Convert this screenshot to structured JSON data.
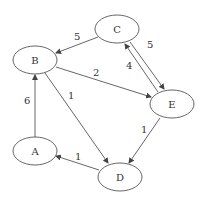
{
  "graph": {
    "type": "weighted directed graph",
    "nodes": [
      {
        "id": "A",
        "label": "A",
        "x": 35,
        "y": 151
      },
      {
        "id": "B",
        "label": "B",
        "x": 35,
        "y": 60
      },
      {
        "id": "C",
        "label": "C",
        "x": 117,
        "y": 29
      },
      {
        "id": "D",
        "label": "D",
        "x": 120,
        "y": 177
      },
      {
        "id": "E",
        "label": "E",
        "x": 172,
        "y": 104
      }
    ],
    "edges": [
      {
        "from": "A",
        "to": "B",
        "weight": "6"
      },
      {
        "from": "C",
        "to": "B",
        "weight": "5"
      },
      {
        "from": "B",
        "to": "E",
        "weight": "2"
      },
      {
        "from": "B",
        "to": "D",
        "weight": "1"
      },
      {
        "from": "C",
        "to": "E",
        "weight": "5"
      },
      {
        "from": "E",
        "to": "C",
        "weight": "4"
      },
      {
        "from": "E",
        "to": "D",
        "weight": "1"
      },
      {
        "from": "D",
        "to": "A",
        "weight": "1"
      }
    ]
  }
}
